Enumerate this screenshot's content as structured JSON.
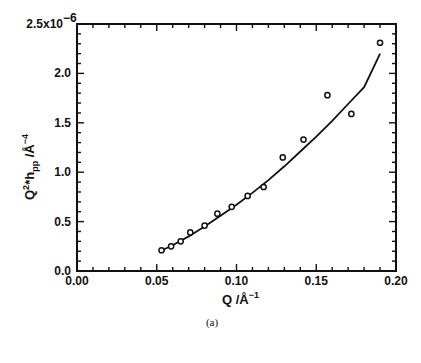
{
  "figure": {
    "caption": "(a)"
  },
  "chart_data": {
    "type": "scatter",
    "title": "",
    "xlabel": "Q /Å⁻¹",
    "xlabel_parts": {
      "base": "Q  /Å",
      "sup": "−1"
    },
    "ylabel": "Q²*h_pp /Å⁻⁴",
    "ylabel_parts": {
      "q": "Q",
      "q_sup": "2",
      "star": "*h",
      "h_sub": "pp",
      "unit": " /Å",
      "unit_sup": "−4"
    },
    "xlim": [
      0.0,
      0.2
    ],
    "ylim": [
      0.0,
      2.5e-06
    ],
    "y_scale_label": "x10⁻⁶",
    "x_ticks": [
      0.0,
      0.05,
      0.1,
      0.15,
      0.2
    ],
    "x_tick_labels": [
      "0.00",
      "0.05",
      "0.10",
      "0.15",
      "0.20"
    ],
    "x_minor_step": 0.01,
    "y_ticks": [
      0.0,
      0.5,
      1.0,
      1.5,
      2.0,
      2.5
    ],
    "y_tick_labels": [
      "0.0",
      "0.5",
      "1.0",
      "1.5",
      "2.0",
      "2.5x10"
    ],
    "y_top_exponent": "−6",
    "y_minor_step": 0.1,
    "grid": false,
    "legend": null,
    "series": [
      {
        "name": "data",
        "style": "open-circle",
        "x": [
          0.053,
          0.059,
          0.065,
          0.071,
          0.08,
          0.088,
          0.097,
          0.107,
          0.117,
          0.129,
          0.142,
          0.157,
          0.172,
          0.19
        ],
        "y": [
          0.21,
          0.25,
          0.3,
          0.39,
          0.46,
          0.58,
          0.65,
          0.76,
          0.85,
          1.15,
          1.33,
          1.78,
          1.59,
          2.31
        ]
      },
      {
        "name": "fit",
        "style": "line",
        "x": [
          0.052,
          0.06,
          0.07,
          0.08,
          0.09,
          0.1,
          0.11,
          0.12,
          0.13,
          0.14,
          0.15,
          0.16,
          0.17,
          0.18,
          0.19
        ],
        "y": [
          0.2,
          0.26,
          0.35,
          0.45,
          0.56,
          0.67,
          0.79,
          0.92,
          1.06,
          1.21,
          1.36,
          1.52,
          1.69,
          1.86,
          2.2
        ]
      }
    ],
    "y_units_multiplier": 1e-06
  }
}
